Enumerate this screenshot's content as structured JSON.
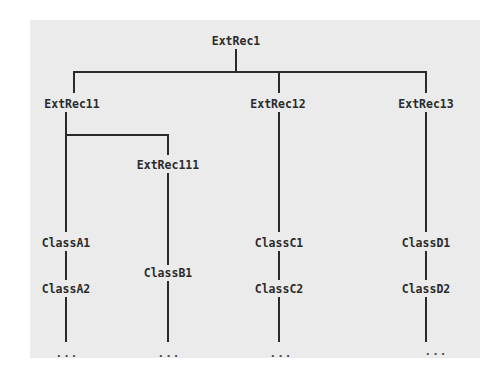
{
  "diagram": {
    "type": "class-hierarchy-tree",
    "root": {
      "label": "ExtRec1"
    },
    "level2": [
      {
        "label": "ExtRec11"
      },
      {
        "label": "ExtRec12"
      },
      {
        "label": "ExtRec13"
      }
    ],
    "level3": [
      {
        "label": "ExtRec111",
        "parent": "ExtRec11"
      }
    ],
    "leaves": {
      "a1": "ClassA1",
      "a2": "ClassA2",
      "b1": "ClassB1",
      "c1": "ClassC1",
      "c2": "ClassC2",
      "d1": "ClassD1",
      "d2": "ClassD2"
    },
    "continuation": "..."
  }
}
